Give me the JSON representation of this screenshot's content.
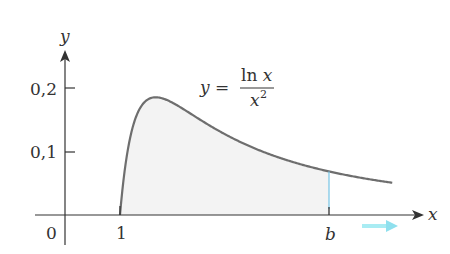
{
  "chart_data": {
    "type": "area",
    "title": "",
    "function_label": {
      "lhs": "y",
      "eq": "=",
      "numerator": "ln x",
      "denominator": "x",
      "exponent": "2"
    },
    "xlabel": "x",
    "ylabel": "y",
    "x_ticks": [
      {
        "value": 0,
        "label": "0"
      },
      {
        "value": 1,
        "label": "1"
      },
      {
        "value": 4.8,
        "label": "b"
      }
    ],
    "y_ticks": [
      {
        "value": 0.1,
        "label": "0,1"
      },
      {
        "value": 0.2,
        "label": "0,2"
      }
    ],
    "xlim": [
      -0.5,
      6.5
    ],
    "ylim": [
      0,
      0.23
    ],
    "grid": false,
    "legend": "none",
    "series": [
      {
        "name": "y = ln x / x^2",
        "x_start": 1,
        "x_end": 5.95,
        "peak": {
          "x": 1.65,
          "y": 0.184
        }
      }
    ],
    "shaded_region": {
      "from": 1,
      "to": "b",
      "b_value": 4.8
    },
    "annotations": [
      {
        "type": "arrow",
        "direction": "right",
        "near": "b",
        "color": "#7fd8e8"
      }
    ],
    "colors": {
      "curve": "#6e6e6e",
      "fill": "#f3f3f3",
      "axis": "#333333",
      "b_line": "#7fc8e6",
      "arrow": "#8fe0ee"
    }
  }
}
